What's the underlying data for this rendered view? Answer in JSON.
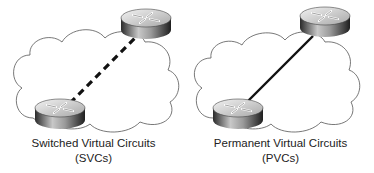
{
  "diagram": {
    "panels": [
      {
        "id": "svc",
        "caption_line1": "Switched Virtual Circuits",
        "caption_line2": "(SVCs)",
        "link_style": "dashed",
        "nodes": [
          "router-top-right",
          "router-bottom-left"
        ],
        "container": "cloud"
      },
      {
        "id": "pvc",
        "caption_line1": "Permanent Virtual Circuits",
        "caption_line2": "(PVCs)",
        "link_style": "solid",
        "nodes": [
          "router-top-right",
          "router-bottom-left"
        ],
        "container": "cloud"
      }
    ],
    "colors": {
      "cloud_stroke": "#555555",
      "link": "#111111",
      "router_top": "#d8d8d8",
      "router_side_dark": "#333333",
      "router_side_light": "#bbbbbb"
    }
  }
}
